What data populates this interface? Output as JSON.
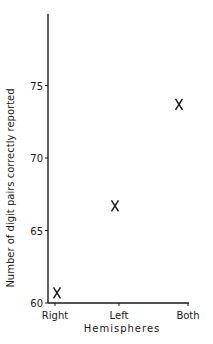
{
  "chart_data": {
    "type": "scatter",
    "title": "",
    "xlabel": "Hemispheres",
    "ylabel": "Number of digit pairs correctly reported",
    "categories": [
      "Right",
      "Left",
      "Both"
    ],
    "series": [
      {
        "name": "Digit pairs correctly reported",
        "marker": "X",
        "values": [
          60.7,
          66.7,
          73.7
        ]
      }
    ],
    "yticks": [
      60,
      65,
      70,
      75
    ],
    "ylim": [
      60,
      79.5
    ],
    "grid": false,
    "legend": null
  },
  "layout": {
    "plot_left": 48,
    "plot_bottom": 303,
    "px_per_unit": 14.5,
    "x_positions": [
      55,
      119,
      188
    ],
    "axis_top": 14,
    "axis_right": 189
  },
  "colors": {
    "ink": "#1a1a1a",
    "background": "#ffffff"
  }
}
